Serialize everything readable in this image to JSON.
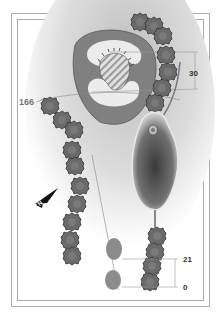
{
  "diagram": {
    "type": "golf-hole-layout",
    "labels": {
      "carry_distance": "166",
      "green_depth": "30",
      "tee_far": "21",
      "tee_near": "0"
    },
    "compass": {
      "icon": "north-arrow-icon",
      "letter": "N"
    },
    "colors": {
      "green_surround": "#7f7f7f",
      "green_surface": "#e8e8e8",
      "bunker": "#8a8a8a",
      "hazard": "#4a4a4a",
      "tree": "#6a6a6a",
      "tee_box": "#8c8c8c",
      "fairway": "#cfcfcf",
      "frame": "#aaaaaa"
    }
  }
}
